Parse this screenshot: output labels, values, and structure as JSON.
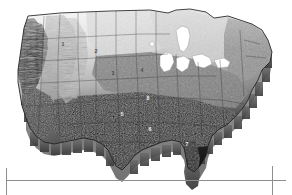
{
  "figure": {
    "kind": "thematic-relief-map",
    "region": "contiguous-united-states",
    "projection_style": "3d-extruded-block",
    "palette": "grayscale",
    "background_color": "#ffffff",
    "frame_color": "#8e8e8e"
  },
  "map": {
    "title": "",
    "lakes_color": "#ffffff",
    "border_color": "#1c1c1c",
    "extrusion_side_color": "#9a9a9a",
    "extrusion_side_shadow": "#6f6f6f"
  },
  "zone_labels": [
    {
      "id": "zone-1",
      "text": "1",
      "x": 63,
      "y": 46,
      "tone": "light"
    },
    {
      "id": "zone-2",
      "text": "2",
      "x": 96,
      "y": 53,
      "tone": "light"
    },
    {
      "id": "zone-3",
      "text": "3",
      "x": 113,
      "y": 75,
      "tone": "light"
    },
    {
      "id": "zone-4",
      "text": "4",
      "x": 142,
      "y": 72,
      "tone": "light"
    },
    {
      "id": "zone-5",
      "text": "5",
      "x": 122,
      "y": 116,
      "tone": "dark"
    },
    {
      "id": "zone-6",
      "text": "6",
      "x": 150,
      "y": 131,
      "tone": "dark"
    },
    {
      "id": "zone-7",
      "text": "7",
      "x": 187,
      "y": 146,
      "tone": "dark"
    },
    {
      "id": "zone-8",
      "text": "8",
      "x": 148,
      "y": 100,
      "tone": "dark"
    }
  ],
  "shading_classes": [
    {
      "name": "very-light",
      "color": "#ededed"
    },
    {
      "name": "light",
      "color": "#d6d6d6"
    },
    {
      "name": "mid-light",
      "color": "#bcbcbc"
    },
    {
      "name": "mid",
      "color": "#9c9c9c"
    },
    {
      "name": "mid-dark",
      "color": "#7a7a7a"
    },
    {
      "name": "dark",
      "color": "#4e4e4e"
    },
    {
      "name": "very-dark",
      "color": "#2a2a2a"
    },
    {
      "name": "darkest",
      "color": "#111111"
    }
  ],
  "frame": {
    "bottom_rule_y": 180,
    "right_rule_x": 272,
    "left_rule_x": 6
  }
}
